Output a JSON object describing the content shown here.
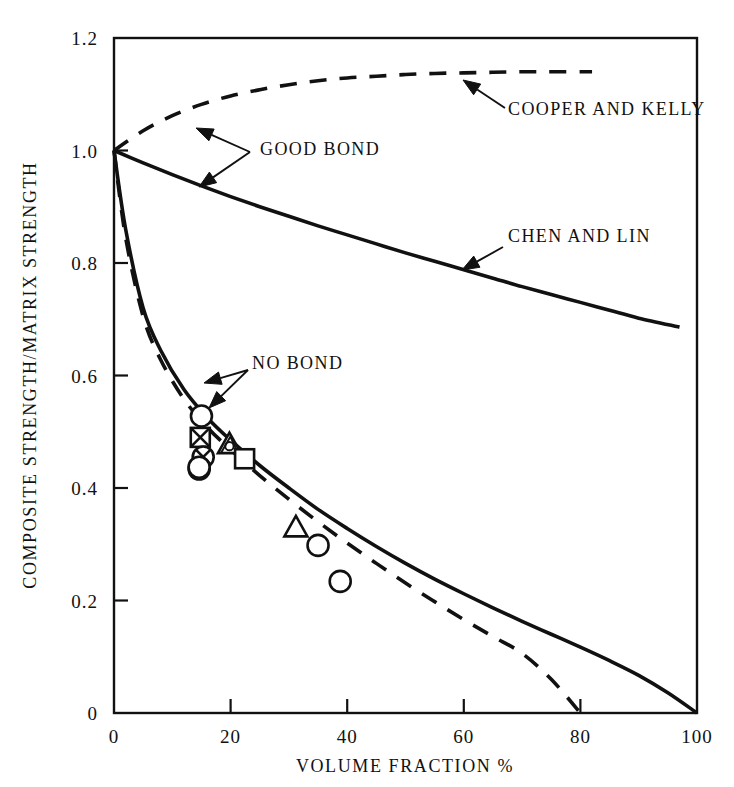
{
  "chart_data": {
    "type": "line",
    "title": "",
    "xlabel": "VOLUME FRACTION  %",
    "ylabel": "COMPOSITE STRENGTH/MATRIX STRENGTH",
    "xlim": [
      0,
      100
    ],
    "ylim": [
      0,
      1.2
    ],
    "grid": false,
    "legend_position": "inline-annotations",
    "xticks": [
      "0",
      "20",
      "40",
      "60",
      "80",
      "100"
    ],
    "xtick_values": [
      0,
      20,
      40,
      60,
      80,
      100
    ],
    "yticks": [
      "0",
      "0.2",
      "0.4",
      "0.6",
      "0.8",
      "1.0",
      "1.2"
    ],
    "ytick_values": [
      0,
      0.2,
      0.4,
      0.6,
      0.8,
      1.0,
      1.2
    ],
    "series": [
      {
        "name": "COOPER AND KELLY",
        "style": "dashed",
        "group": "GOOD BOND",
        "x": [
          0,
          5,
          10,
          15,
          20,
          25,
          30,
          35,
          40,
          45,
          50,
          55,
          60,
          65,
          70,
          75,
          82
        ],
        "values": [
          1.0,
          1.035,
          1.062,
          1.082,
          1.097,
          1.108,
          1.117,
          1.124,
          1.129,
          1.132,
          1.135,
          1.137,
          1.138,
          1.139,
          1.14,
          1.14,
          1.14
        ]
      },
      {
        "name": "CHEN AND LIN",
        "style": "solid",
        "group": "GOOD BOND",
        "x": [
          0,
          5,
          10,
          15,
          20,
          25,
          30,
          35,
          40,
          45,
          50,
          55,
          60,
          65,
          70,
          75,
          80,
          85,
          90,
          97
        ],
        "values": [
          1.0,
          0.978,
          0.957,
          0.937,
          0.918,
          0.9,
          0.883,
          0.866,
          0.85,
          0.834,
          0.818,
          0.803,
          0.788,
          0.773,
          0.758,
          0.744,
          0.73,
          0.716,
          0.702,
          0.686
        ]
      },
      {
        "name": "NO BOND (solid)",
        "style": "solid",
        "group": "NO BOND",
        "x": [
          0,
          2,
          5,
          8,
          12,
          16,
          20,
          25,
          30,
          35,
          40,
          45,
          50,
          55,
          60,
          65,
          70,
          75,
          80,
          85,
          90,
          95,
          100
        ],
        "values": [
          1.0,
          0.86,
          0.72,
          0.645,
          0.575,
          0.525,
          0.485,
          0.44,
          0.4,
          0.362,
          0.328,
          0.296,
          0.266,
          0.238,
          0.212,
          0.187,
          0.163,
          0.14,
          0.117,
          0.093,
          0.067,
          0.036,
          0.0
        ]
      },
      {
        "name": "NO BOND (dashed)",
        "style": "dashed",
        "group": "NO BOND",
        "x": [
          0,
          2,
          5,
          8,
          12,
          16,
          20,
          25,
          30,
          35,
          40,
          45,
          50,
          55,
          60,
          65,
          70,
          75,
          80
        ],
        "values": [
          1.0,
          0.845,
          0.705,
          0.628,
          0.558,
          0.508,
          0.468,
          0.422,
          0.38,
          0.34,
          0.302,
          0.266,
          0.231,
          0.198,
          0.166,
          0.136,
          0.106,
          0.06,
          0.0
        ]
      }
    ],
    "scatter_points": [
      {
        "marker": "circle-open",
        "x": 15.0,
        "y": 0.528
      },
      {
        "marker": "square-crossed",
        "x": 14.8,
        "y": 0.49
      },
      {
        "marker": "triangle-overlap",
        "x": 19.8,
        "y": 0.478
      },
      {
        "marker": "circle-crossed",
        "x": 15.3,
        "y": 0.455
      },
      {
        "marker": "circle-open",
        "x": 14.6,
        "y": 0.437
      },
      {
        "marker": "square-open",
        "x": 22.4,
        "y": 0.452
      },
      {
        "marker": "triangle-open",
        "x": 31.2,
        "y": 0.33
      },
      {
        "marker": "circle-open",
        "x": 35.0,
        "y": 0.298
      },
      {
        "marker": "circle-open",
        "x": 38.8,
        "y": 0.234
      }
    ],
    "annotations": [
      {
        "label": "COOPER AND KELLY",
        "text_x": 508,
        "text_y": 115,
        "arrow_from_x": 505,
        "arrow_from_y": 108,
        "arrow_to_x": 463,
        "arrow_to_y": 80
      },
      {
        "label": "GOOD BOND",
        "text_x": 260,
        "text_y": 155,
        "arrow_from_x": 252,
        "arrow_from_y": 150,
        "arrow_to_x": 196,
        "arrow_to_y": 128
      },
      {
        "label": "CHEN AND LIN",
        "text_x": 508,
        "text_y": 242,
        "arrow_from_x": 503,
        "arrow_from_y": 245,
        "arrow_to_x": 462,
        "arrow_to_y": 268
      },
      {
        "label": "NO BOND",
        "text_x": 252,
        "text_y": 369,
        "arrow_from_x": 246,
        "arrow_from_y": 369,
        "arrow_to_x": 205,
        "arrow_to_y": 383
      }
    ]
  },
  "axes": {
    "x_title": "VOLUME FRACTION  %",
    "y_title": "COMPOSITE STRENGTH/MATRIX STRENGTH"
  },
  "colors": {
    "ink": "#111111",
    "background": "#ffffff"
  }
}
